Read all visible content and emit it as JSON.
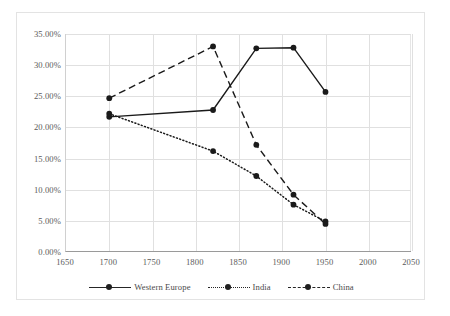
{
  "chart_data": {
    "type": "line",
    "title": "",
    "subtitle": "",
    "xlabel": "",
    "ylabel": "",
    "xlim": [
      1650,
      2050
    ],
    "ylim": [
      0,
      35
    ],
    "xticks": [
      1650,
      1700,
      1750,
      1800,
      1850,
      1900,
      1950,
      2000,
      2050
    ],
    "xtick_labels": [
      "1650",
      "1700",
      "1750",
      "1800",
      "1850",
      "1900",
      "1950",
      "2000",
      "2050"
    ],
    "yticks": [
      0,
      5,
      10,
      15,
      20,
      25,
      30,
      35
    ],
    "ytick_labels": [
      "0.00%",
      "5.00%",
      "10.00%",
      "15.00%",
      "20.00%",
      "25.00%",
      "30.00%",
      "35.00%"
    ],
    "grid": "horizontal-and-vertical",
    "legend_position": "bottom",
    "x": [
      1700,
      1820,
      1870,
      1913,
      1950
    ],
    "series": [
      {
        "name": "Western Europe",
        "style": "solid",
        "marker": "circle",
        "color": "#1a1a1a",
        "values": [
          21.7,
          22.8,
          32.7,
          32.8,
          25.7
        ]
      },
      {
        "name": "India",
        "style": "dotted",
        "marker": "circle",
        "color": "#1a1a1a",
        "values": [
          22.2,
          16.2,
          12.2,
          7.6,
          4.9
        ]
      },
      {
        "name": "China",
        "style": "dashed",
        "marker": "circle",
        "color": "#1a1a1a",
        "values": [
          24.7,
          33.0,
          17.2,
          9.2,
          4.5
        ]
      }
    ]
  },
  "legend": {
    "items": [
      {
        "label": "Western Europe"
      },
      {
        "label": "India"
      },
      {
        "label": "China"
      }
    ]
  }
}
